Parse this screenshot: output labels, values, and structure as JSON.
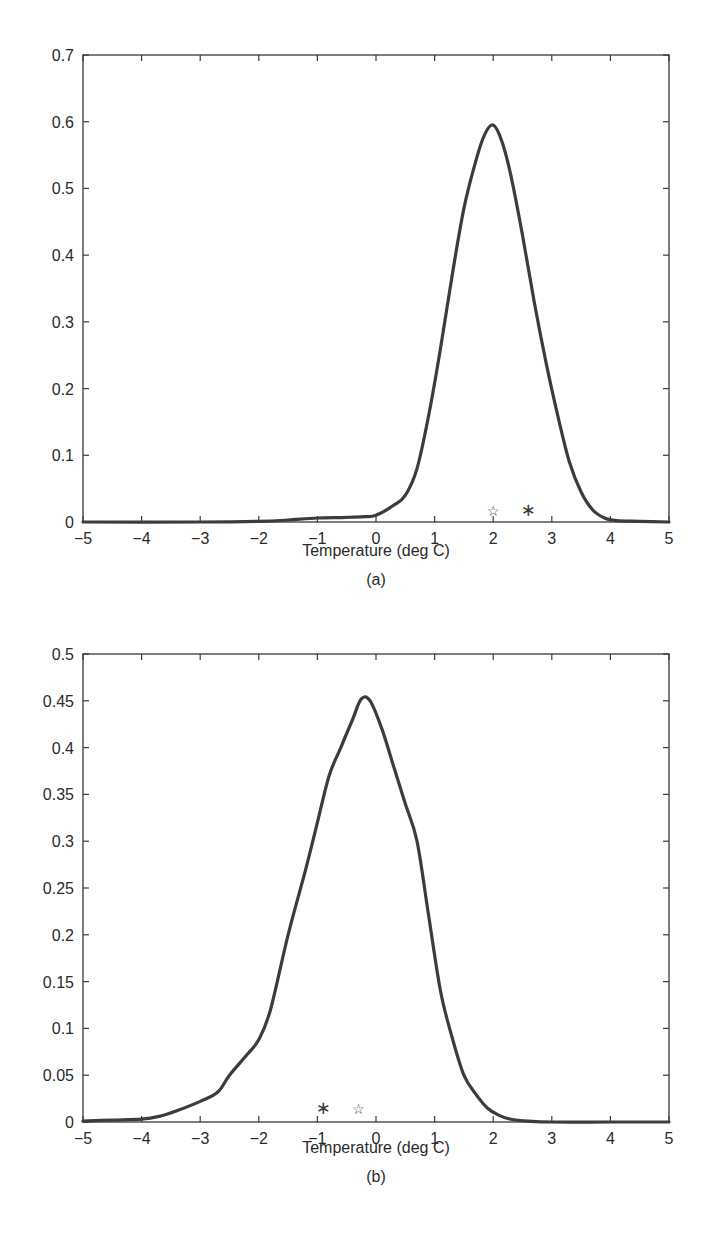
{
  "chart_data": [
    {
      "type": "line",
      "panel_label": "(a)",
      "title": "",
      "xlabel": "Temperature (deg C)",
      "ylabel": "",
      "xlim": [
        -5,
        5
      ],
      "ylim": [
        0,
        0.7
      ],
      "xticks": [
        "-5",
        "-4",
        "-3",
        "-2",
        "-1",
        "0",
        "1",
        "2",
        "3",
        "4",
        "5"
      ],
      "yticks": [
        "0",
        "0.1",
        "0.2",
        "0.3",
        "0.4",
        "0.5",
        "0.6",
        "0.7"
      ],
      "grid": false,
      "series": [
        {
          "name": "density",
          "x": [
            -5,
            -3,
            -2,
            -1.5,
            -1,
            -0.5,
            -0.2,
            0,
            0.3,
            0.5,
            0.7,
            0.9,
            1.1,
            1.3,
            1.5,
            1.7,
            1.85,
            2.0,
            2.15,
            2.3,
            2.5,
            2.7,
            2.9,
            3.1,
            3.3,
            3.5,
            3.7,
            3.9,
            4.1,
            4.5,
            5
          ],
          "values": [
            0,
            0,
            0.001,
            0.003,
            0.006,
            0.007,
            0.008,
            0.01,
            0.025,
            0.04,
            0.08,
            0.16,
            0.26,
            0.37,
            0.47,
            0.54,
            0.58,
            0.595,
            0.57,
            0.52,
            0.43,
            0.33,
            0.24,
            0.16,
            0.09,
            0.045,
            0.018,
            0.006,
            0.002,
            0.001,
            0
          ]
        }
      ],
      "markers": [
        {
          "symbol": "star",
          "x": 2.0,
          "y": 0.01
        },
        {
          "symbol": "asterisk",
          "x": 2.6,
          "y": 0.01
        }
      ]
    },
    {
      "type": "line",
      "panel_label": "(b)",
      "title": "",
      "xlabel": "Temperature (deg C)",
      "ylabel": "",
      "xlim": [
        -5,
        5
      ],
      "ylim": [
        0,
        0.5
      ],
      "xticks": [
        "-5",
        "-4",
        "-3",
        "-2",
        "-1",
        "0",
        "1",
        "2",
        "3",
        "4",
        "5"
      ],
      "yticks": [
        "0",
        "0.05",
        "0.1",
        "0.15",
        "0.2",
        "0.25",
        "0.3",
        "0.35",
        "0.4",
        "0.45",
        "0.5"
      ],
      "grid": false,
      "series": [
        {
          "name": "density",
          "x": [
            -5,
            -4.5,
            -4,
            -3.7,
            -3.4,
            -3.0,
            -2.7,
            -2.5,
            -2.2,
            -2.0,
            -1.8,
            -1.5,
            -1.2,
            -1.0,
            -0.8,
            -0.6,
            -0.4,
            -0.25,
            -0.1,
            0.1,
            0.3,
            0.5,
            0.7,
            0.9,
            1.1,
            1.3,
            1.5,
            1.7,
            1.9,
            2.1,
            2.3,
            2.6,
            3.0,
            4.0,
            5.0
          ],
          "values": [
            0.001,
            0.002,
            0.003,
            0.006,
            0.012,
            0.022,
            0.032,
            0.05,
            0.072,
            0.088,
            0.12,
            0.2,
            0.27,
            0.32,
            0.37,
            0.4,
            0.43,
            0.452,
            0.45,
            0.42,
            0.38,
            0.34,
            0.3,
            0.22,
            0.14,
            0.09,
            0.05,
            0.03,
            0.015,
            0.007,
            0.003,
            0.001,
            0,
            0,
            0
          ]
        }
      ],
      "markers": [
        {
          "symbol": "asterisk",
          "x": -0.9,
          "y": 0.01
        },
        {
          "symbol": "star",
          "x": -0.3,
          "y": 0.01
        }
      ]
    }
  ]
}
